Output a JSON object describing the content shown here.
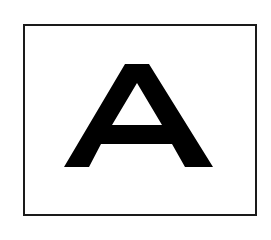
{
  "sign": {
    "letter": "A",
    "border_color": "#1a1a1a",
    "letter_color": "#000000",
    "background": "#ffffff"
  }
}
